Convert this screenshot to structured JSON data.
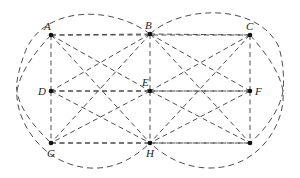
{
  "diagram": {
    "points": [
      {
        "id": "A",
        "label": "A",
        "x": 51,
        "y": 35,
        "lx": 44,
        "ly": 30
      },
      {
        "id": "B",
        "label": "B",
        "x": 150,
        "y": 34,
        "lx": 145,
        "ly": 29
      },
      {
        "id": "C",
        "label": "C",
        "x": 250,
        "y": 35,
        "lx": 246,
        "ly": 30
      },
      {
        "id": "D",
        "label": "D",
        "x": 51,
        "y": 91,
        "lx": 38,
        "ly": 95
      },
      {
        "id": "E",
        "label": "E",
        "x": 150,
        "y": 91,
        "lx": 142,
        "ly": 86
      },
      {
        "id": "F",
        "label": "F",
        "x": 250,
        "y": 91,
        "lx": 255,
        "ly": 95
      },
      {
        "id": "G",
        "label": "G",
        "x": 51,
        "y": 143,
        "lx": 47,
        "ly": 157
      },
      {
        "id": "H",
        "label": "H",
        "x": 150,
        "y": 143,
        "lx": 146,
        "ly": 157
      },
      {
        "id": "I",
        "label": "",
        "x": 250,
        "y": 143,
        "lx": 250,
        "ly": 157
      }
    ],
    "segments": [
      [
        "A",
        "B"
      ],
      [
        "B",
        "C"
      ],
      [
        "D",
        "E"
      ],
      [
        "E",
        "F"
      ],
      [
        "G",
        "H"
      ],
      [
        "H",
        "I"
      ],
      [
        "A",
        "D"
      ],
      [
        "D",
        "G"
      ],
      [
        "B",
        "E"
      ],
      [
        "E",
        "H"
      ],
      [
        "C",
        "F"
      ],
      [
        "F",
        "I"
      ],
      [
        "A",
        "E"
      ],
      [
        "E",
        "I"
      ],
      [
        "C",
        "E"
      ],
      [
        "E",
        "G"
      ],
      [
        "B",
        "D"
      ],
      [
        "D",
        "H"
      ],
      [
        "B",
        "F"
      ],
      [
        "F",
        "H"
      ],
      [
        "A",
        "H"
      ],
      [
        "B",
        "G"
      ],
      [
        "B",
        "I"
      ],
      [
        "C",
        "H"
      ],
      [
        "D",
        "F"
      ],
      [
        "G",
        "I"
      ],
      [
        "A",
        "C"
      ]
    ],
    "curves": [
      "M150,34 C110,4 40,6 24,55 C16,78 16,88 17,91 C19,108 35,128 51,143",
      "M51,35 C35,52 20,72 17,91 C15,118 40,165 90,168 C120,170 140,152 150,143",
      "M150,34 C180,6 255,2 278,45 C284,62 284,80 283,91 C280,110 265,130 250,143",
      "M250,35 C265,52 280,72 283,91 C286,120 262,168 210,168 C180,168 160,152 150,143"
    ]
  }
}
